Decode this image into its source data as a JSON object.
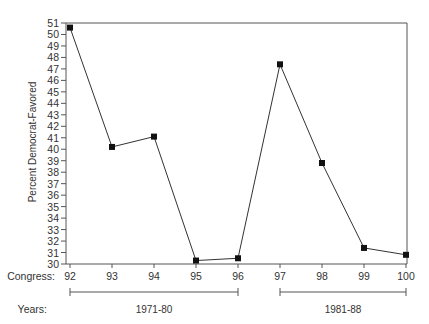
{
  "chart_data": {
    "type": "line",
    "title": "",
    "xlabel": "Congress:",
    "ylabel": "Percent Democrat-Favored",
    "x": [
      92,
      93,
      94,
      95,
      96,
      97,
      98,
      99,
      100
    ],
    "series": [
      {
        "name": "Percent Democrat-Favored",
        "values": [
          50.6,
          40.2,
          41.1,
          30.3,
          30.5,
          47.4,
          38.8,
          31.4,
          30.8
        ]
      }
    ],
    "ylim": [
      30,
      51
    ],
    "yticks": [
      30,
      31,
      32,
      33,
      34,
      35,
      36,
      37,
      38,
      39,
      40,
      41,
      42,
      43,
      44,
      45,
      46,
      47,
      48,
      49,
      50,
      51
    ],
    "xticks": [
      "92",
      "93",
      "94",
      "95",
      "96",
      "97",
      "98",
      "99",
      "100"
    ],
    "grid": false,
    "marker": "square",
    "year_ranges": [
      {
        "label": "1971-80",
        "from": 92,
        "to": 96
      },
      {
        "label": "1981-88",
        "from": 97,
        "to": 100
      }
    ],
    "years_label": "Years:"
  },
  "colors": {
    "line": "#333333",
    "frame": "#555555",
    "marker": "#111111"
  }
}
